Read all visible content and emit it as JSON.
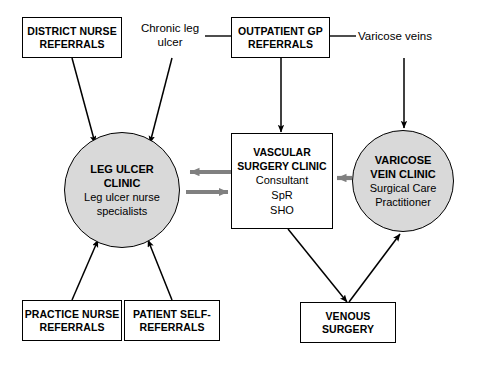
{
  "diagram": {
    "colors": {
      "stroke": "#000000",
      "clinic_fill": "#d9d9d9",
      "comms_arrow": "#808080",
      "background": "#ffffff"
    },
    "boxes": [
      {
        "id": "district-nurse-referrals",
        "lines": [
          "DISTRICT NURSE",
          "REFERRALS"
        ]
      },
      {
        "id": "outpatient-gp-referrals",
        "lines": [
          "OUTPATIENT GP",
          "REFERRALS"
        ]
      },
      {
        "id": "practice-nurse-referrals",
        "lines": [
          "PRACTICE NURSE",
          "REFERRALS"
        ]
      },
      {
        "id": "patient-self-referrals",
        "lines": [
          "PATIENT SELF-",
          "REFERRALS"
        ]
      },
      {
        "id": "venous-surgery",
        "lines": [
          "VENOUS",
          "SURGERY"
        ]
      }
    ],
    "center_box": {
      "id": "vascular-surgery-clinic",
      "title_lines": [
        "VASCULAR",
        "SURGERY CLINIC"
      ],
      "roles": [
        "Consultant",
        "SpR",
        "SHO"
      ]
    },
    "clinics": [
      {
        "id": "leg-ulcer-clinic",
        "title_lines": [
          "LEG ULCER",
          "CLINIC"
        ],
        "sub_lines": [
          "Leg ulcer nurse",
          "specialists"
        ]
      },
      {
        "id": "varicose-vein-clinic",
        "title_lines": [
          "VARICOSE",
          "VEIN CLINIC"
        ],
        "sub_lines": [
          "Surgical Care",
          "Practitioner"
        ]
      }
    ],
    "annotations": [
      {
        "id": "chronic-leg-ulcer",
        "lines": [
          "Chronic leg",
          "ulcer"
        ]
      },
      {
        "id": "varicose-veins",
        "lines": [
          "Varicose veins"
        ]
      }
    ]
  }
}
